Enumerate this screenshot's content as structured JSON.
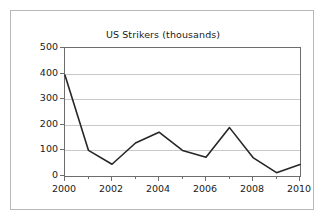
{
  "figure": {
    "background_color": "#ffffff",
    "border_color": "#b8b8b8",
    "axis_color": "#6d6d6d",
    "grid_color": "#c9c9c9",
    "line_color": "#262626",
    "text_color": "#1a1a1a"
  },
  "chart_data": {
    "type": "line",
    "title": "US Strikers (thousands)",
    "xlabel": "",
    "ylabel": "",
    "x": [
      2000,
      2001,
      2002,
      2003,
      2004,
      2005,
      2006,
      2007,
      2008,
      2009,
      2010
    ],
    "values": [
      394,
      100,
      46,
      129,
      171,
      100,
      73,
      189,
      72,
      13,
      45
    ],
    "series": [
      {
        "name": "US Strikers (thousands)",
        "values": [
          394,
          100,
          46,
          129,
          171,
          100,
          73,
          189,
          72,
          13,
          45
        ]
      }
    ],
    "xlim": [
      2000,
      2010
    ],
    "ylim": [
      0,
      500
    ],
    "ytick_labels": [
      "0",
      "100",
      "200",
      "300",
      "400",
      "500"
    ],
    "ytick_values": [
      0,
      100,
      200,
      300,
      400,
      500
    ],
    "xtick_labels": [
      "2000",
      "2002",
      "2004",
      "2006",
      "2008",
      "2010"
    ],
    "xtick_values": [
      2000,
      2002,
      2004,
      2006,
      2008,
      2010
    ],
    "xminor_tick_values": [
      2001,
      2003,
      2005,
      2007,
      2009
    ],
    "grid": "horizontal",
    "legend": "none",
    "marker": "none"
  }
}
